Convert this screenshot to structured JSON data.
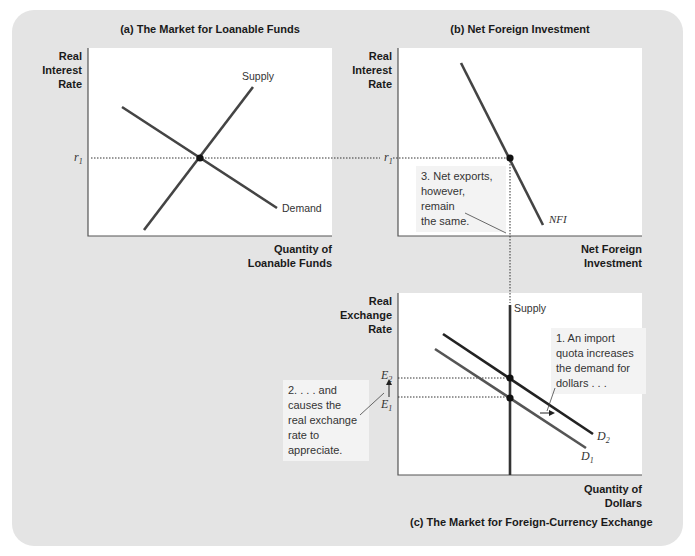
{
  "panels": {
    "a": {
      "title": "(a) The Market for Loanable Funds",
      "y_label": [
        "Real",
        "Interest",
        "Rate"
      ],
      "x_label": [
        "Quantity of",
        "Loanable Funds"
      ],
      "supply_label": "Supply",
      "demand_label": "Demand",
      "rate_label": "r",
      "rate_sub": "1"
    },
    "b": {
      "title": "(b) Net Foreign Investment",
      "y_label": [
        "Real",
        "Interest",
        "Rate"
      ],
      "x_label": [
        "Net Foreign",
        "Investment"
      ],
      "curve_label": "NFI",
      "rate_label": "r",
      "rate_sub": "1",
      "note": [
        "3. Net exports,",
        "however, remain",
        "the same."
      ]
    },
    "c": {
      "title": "(c) The Market for Foreign-Currency Exchange",
      "y_label": [
        "Real",
        "Exchange",
        "Rate"
      ],
      "x_label": [
        "Quantity of",
        "Dollars"
      ],
      "supply_label": "Supply",
      "d1_label": "D",
      "d1_sub": "1",
      "d2_label": "D",
      "d2_sub": "2",
      "e1_label": "E",
      "e1_sub": "1",
      "e2_label": "E",
      "e2_sub": "2",
      "note1": [
        "1. An import",
        "quota increases",
        "the demand for",
        "dollars . . ."
      ],
      "note2": [
        "2. . . . and",
        "causes the",
        "real exchange",
        "rate to",
        "appreciate."
      ]
    }
  },
  "colors": {
    "background_panel": "#e4e4e4",
    "plot_area": "#ffffff",
    "curve": "#333333",
    "curve_light": "#555555",
    "note_bg": "#f3f3f3"
  }
}
